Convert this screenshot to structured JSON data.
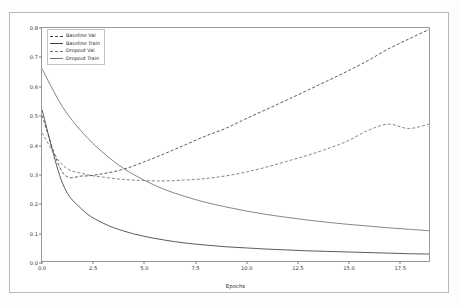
{
  "figure": {
    "xlabel": "Epochs",
    "ylabel": "Binary Crossentropy"
  },
  "legend": {
    "items": [
      {
        "label": "Baseline Val",
        "style": "dashed",
        "color": "#3f3f3f"
      },
      {
        "label": "Baseline Train",
        "style": "solid",
        "color": "#3f3f3f"
      },
      {
        "label": "Dropout Val",
        "style": "dashed",
        "color": "#707070"
      },
      {
        "label": "Dropout Train",
        "style": "solid",
        "color": "#707070"
      }
    ]
  },
  "axis": {
    "yticks": [
      "0.0",
      "0.1",
      "0.2",
      "0.3",
      "0.4",
      "0.5",
      "0.6",
      "0.7",
      "0.8"
    ],
    "ytick_values": [
      0.0,
      0.1,
      0.2,
      0.3,
      0.4,
      0.5,
      0.6,
      0.7,
      0.8
    ],
    "xticks": [
      "0.0",
      "2.5",
      "5.0",
      "7.5",
      "10.0",
      "12.5",
      "15.0",
      "17.5"
    ],
    "xtick_values": [
      0.0,
      2.5,
      5.0,
      7.5,
      10.0,
      12.5,
      15.0,
      17.5
    ]
  },
  "chart_data": {
    "type": "line",
    "title": "",
    "xlabel": "Epochs",
    "ylabel": "Binary Crossentropy",
    "xlim": [
      0,
      19
    ],
    "ylim": [
      0.0,
      0.8
    ],
    "grid": false,
    "legend_position": "upper left",
    "x": [
      0,
      1,
      2,
      3,
      4,
      5,
      6,
      7,
      8,
      9,
      10,
      11,
      12,
      13,
      14,
      15,
      16,
      17,
      18,
      19
    ],
    "series": [
      {
        "name": "Baseline Val",
        "linestyle": "dashed",
        "color": "#3f3f3f",
        "values": [
          0.5,
          0.305,
          0.292,
          0.3,
          0.315,
          0.34,
          0.368,
          0.398,
          0.428,
          0.455,
          0.488,
          0.52,
          0.552,
          0.585,
          0.618,
          0.652,
          0.688,
          0.728,
          0.762,
          0.795
        ]
      },
      {
        "name": "Baseline Train",
        "linestyle": "solid",
        "color": "#3f3f3f",
        "values": [
          0.52,
          0.268,
          0.175,
          0.13,
          0.103,
          0.085,
          0.072,
          0.062,
          0.055,
          0.049,
          0.045,
          0.041,
          0.038,
          0.035,
          0.033,
          0.031,
          0.029,
          0.027,
          0.025,
          0.024
        ]
      },
      {
        "name": "Dropout Val",
        "linestyle": "dashed",
        "color": "#707070",
        "values": [
          0.44,
          0.33,
          0.3,
          0.288,
          0.28,
          0.276,
          0.275,
          0.278,
          0.283,
          0.292,
          0.305,
          0.322,
          0.342,
          0.362,
          0.385,
          0.412,
          0.448,
          0.47,
          0.455,
          0.47
        ]
      },
      {
        "name": "Dropout Train",
        "linestyle": "solid",
        "color": "#707070",
        "values": [
          0.66,
          0.53,
          0.44,
          0.372,
          0.318,
          0.278,
          0.246,
          0.222,
          0.202,
          0.186,
          0.172,
          0.16,
          0.15,
          0.141,
          0.133,
          0.126,
          0.12,
          0.114,
          0.109,
          0.104
        ]
      }
    ],
    "annotations": [
      "Dropout Val reaches ~0.53 at final epoch on the right axis",
      "Baseline Val diverges upward after its minimum near epoch 2"
    ]
  }
}
